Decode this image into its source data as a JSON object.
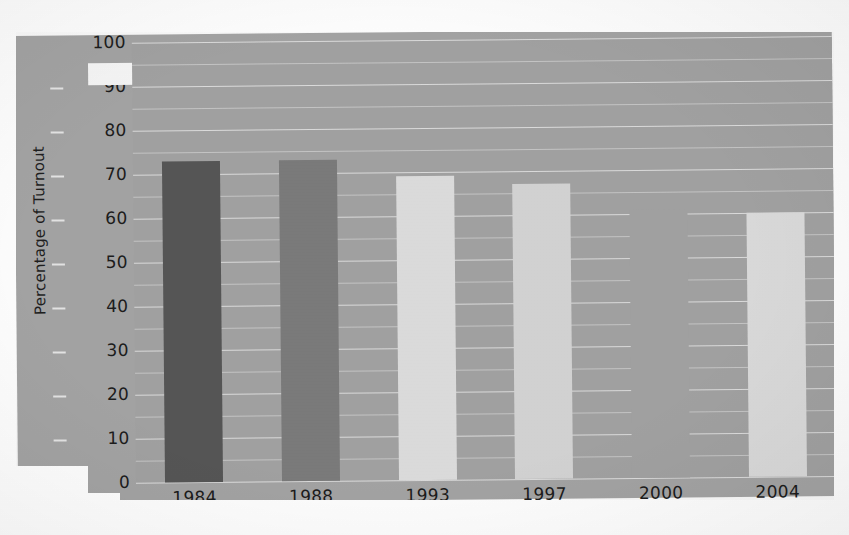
{
  "chart_data": {
    "type": "bar",
    "title": "",
    "xlabel": "",
    "ylabel": "Percentage of Turnout",
    "categories": [
      "1984",
      "1988",
      "1993",
      "1997",
      "2000",
      "2004"
    ],
    "values": [
      73,
      73,
      69,
      67,
      61,
      60
    ],
    "ylim": [
      0,
      100
    ],
    "ytick_labels": [
      "100",
      "90",
      "80",
      "70",
      "60",
      "50",
      "40",
      "30",
      "20",
      "10",
      "0"
    ],
    "ytick_values": [
      100,
      90,
      80,
      70,
      60,
      50,
      40,
      30,
      20,
      10,
      0
    ],
    "ytick_step": 10,
    "minor_gridlines": true,
    "grid": true,
    "legend": "none",
    "bar_colors": [
      "#565656",
      "#7b7b7b",
      "#dcdcdc",
      "#d3d3d3",
      "#a2a2a2",
      "#dadada"
    ],
    "series": [
      {
        "name": "Percentage of Turnout",
        "points": [
          {
            "category": "1984",
            "value": 73,
            "color": "#565656"
          },
          {
            "category": "1988",
            "value": 73,
            "color": "#7b7b7b"
          },
          {
            "category": "1993",
            "value": 69,
            "color": "#dcdcdc"
          },
          {
            "category": "1997",
            "value": 67,
            "color": "#d3d3d3"
          },
          {
            "category": "2000",
            "value": 61,
            "color": "#a2a2a2"
          },
          {
            "category": "2004",
            "value": 60,
            "color": "#dadada"
          }
        ]
      }
    ]
  },
  "colors": {
    "plot_background": "#a2a2a2",
    "card_background": "#a4a4a4",
    "page_background": "#ffffff",
    "gridline": "#ffffff",
    "text": "#1c1c1c"
  },
  "axis": {
    "y_title": "Percentage of Turnout"
  }
}
